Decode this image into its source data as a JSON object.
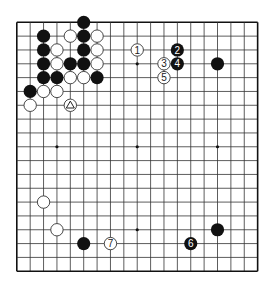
{
  "board": {
    "size": 19,
    "origin_x": 16.8,
    "origin_y": 22.3,
    "spacing_x": 13.38,
    "spacing_y": 13.83,
    "stone_radius": 6.6,
    "line_color": "#333333",
    "edge_color": "#111111",
    "background": "#ffffff",
    "black_color": "#111111",
    "white_fill": "#ffffff",
    "white_stroke": "#333333"
  },
  "hoshi": [
    [
      3,
      3
    ],
    [
      9,
      3
    ],
    [
      15,
      3
    ],
    [
      3,
      9
    ],
    [
      9,
      9
    ],
    [
      15,
      9
    ],
    [
      3,
      15
    ],
    [
      9,
      15
    ],
    [
      15,
      15
    ]
  ],
  "stones": [
    {
      "color": "black",
      "col": 5,
      "row": 0
    },
    {
      "color": "black",
      "col": 2,
      "row": 1
    },
    {
      "color": "white",
      "col": 4,
      "row": 1
    },
    {
      "color": "black",
      "col": 5,
      "row": 1
    },
    {
      "color": "white",
      "col": 6,
      "row": 1
    },
    {
      "color": "black",
      "col": 2,
      "row": 2
    },
    {
      "color": "white",
      "col": 3,
      "row": 2
    },
    {
      "color": "black",
      "col": 5,
      "row": 2
    },
    {
      "color": "white",
      "col": 6,
      "row": 2
    },
    {
      "color": "black",
      "col": 2,
      "row": 3
    },
    {
      "color": "white",
      "col": 3,
      "row": 3
    },
    {
      "color": "black",
      "col": 4,
      "row": 3
    },
    {
      "color": "black",
      "col": 5,
      "row": 3
    },
    {
      "color": "white",
      "col": 6,
      "row": 3
    },
    {
      "color": "black",
      "col": 2,
      "row": 4
    },
    {
      "color": "black",
      "col": 3,
      "row": 4
    },
    {
      "color": "white",
      "col": 4,
      "row": 4
    },
    {
      "color": "white",
      "col": 5,
      "row": 4
    },
    {
      "color": "black",
      "col": 6,
      "row": 4
    },
    {
      "color": "black",
      "col": 1,
      "row": 5
    },
    {
      "color": "white",
      "col": 2,
      "row": 5
    },
    {
      "color": "white",
      "col": 3,
      "row": 5
    },
    {
      "color": "white",
      "col": 1,
      "row": 6
    },
    {
      "color": "white",
      "col": 4,
      "row": 6,
      "mark": "triangle"
    },
    {
      "color": "white",
      "col": 9,
      "row": 2,
      "label": "1"
    },
    {
      "color": "black",
      "col": 12,
      "row": 2,
      "label": "2"
    },
    {
      "color": "white",
      "col": 11,
      "row": 3,
      "label": "3"
    },
    {
      "color": "black",
      "col": 12,
      "row": 3,
      "label": "4"
    },
    {
      "color": "white",
      "col": 11,
      "row": 4,
      "label": "5"
    },
    {
      "color": "black",
      "col": 15,
      "row": 3
    },
    {
      "color": "white",
      "col": 2,
      "row": 13
    },
    {
      "color": "white",
      "col": 3,
      "row": 15
    },
    {
      "color": "black",
      "col": 5,
      "row": 16
    },
    {
      "color": "white",
      "col": 7,
      "row": 16,
      "label": "7"
    },
    {
      "color": "black",
      "col": 13,
      "row": 16,
      "label": "6"
    },
    {
      "color": "black",
      "col": 15,
      "row": 15
    }
  ]
}
